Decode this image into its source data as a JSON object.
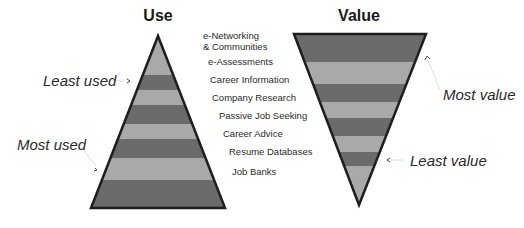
{
  "titles": {
    "use": "Use",
    "value": "Value"
  },
  "categories": [
    "e-Networking\n& Communities",
    "e-Assessments",
    "Career Information",
    "Company Research",
    "Passive Job Seeking",
    "Career Advice",
    "Resume Databases",
    "Job Banks"
  ],
  "category_lines": [
    [
      "e-Networking",
      "& Communities"
    ],
    [
      "e-Assessments"
    ],
    [
      "Career Information"
    ],
    [
      "Company Research"
    ],
    [
      "Passive Job Seeking"
    ],
    [
      "Career Advice"
    ],
    [
      "Resume Databases"
    ],
    [
      "Job Banks"
    ]
  ],
  "callouts": {
    "least_used": "Least used",
    "most_used": "Most used",
    "most_value": "Most value",
    "least_value": "Least value"
  },
  "colors": {
    "light_band": "#a9a9a9",
    "dark_band": "#6b6b6b",
    "outline": "#1e1e1e"
  },
  "use_pyramid": {
    "apex": [
      158,
      36
    ],
    "base_y": 208,
    "base_left": 91,
    "base_right": 225,
    "band_edges": [
      36,
      75,
      90,
      105,
      124,
      139,
      158,
      180,
      208
    ]
  },
  "value_pyramid": {
    "top_y": 34,
    "top_left": 294,
    "top_right": 426,
    "apex": [
      359,
      205
    ],
    "band_edges": [
      34,
      62,
      84,
      102,
      118,
      136,
      152,
      166,
      205
    ]
  }
}
